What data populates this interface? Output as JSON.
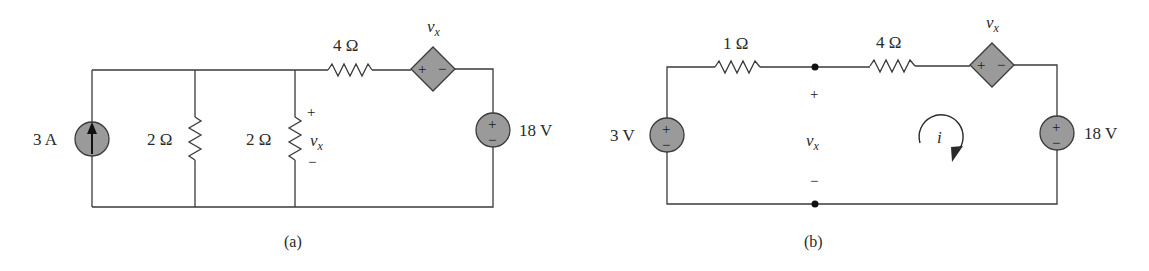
{
  "figure": {
    "panels": [
      {
        "id": "a",
        "caption": "(a)",
        "components": {
          "current_source": {
            "label": "3 A",
            "direction": "up"
          },
          "resistor_1": {
            "label": "2 Ω"
          },
          "resistor_2": {
            "label": "2 Ω",
            "voltage": {
              "plus": "+",
              "var": "v",
              "sub": "x",
              "minus": "−"
            }
          },
          "resistor_3": {
            "label": "4 Ω"
          },
          "dependent_source": {
            "label_var": "v",
            "label_sub": "x",
            "plus": "+",
            "minus": "−"
          },
          "voltage_source": {
            "label": "18 V",
            "plus": "+",
            "minus": "−"
          }
        }
      },
      {
        "id": "b",
        "caption": "(b)",
        "components": {
          "voltage_source_left": {
            "label": "3 V",
            "plus": "+",
            "minus": "−"
          },
          "resistor_1": {
            "label": "1 Ω"
          },
          "resistor_2": {
            "label": "4 Ω"
          },
          "node_voltage": {
            "plus": "+",
            "var": "v",
            "sub": "x",
            "minus": "−"
          },
          "dependent_source": {
            "label_var": "v",
            "label_sub": "x",
            "plus": "+",
            "minus": "−"
          },
          "voltage_source_right": {
            "label": "18 V",
            "plus": "+",
            "minus": "−"
          },
          "mesh_current": {
            "label": "i",
            "direction": "clockwise"
          }
        }
      }
    ]
  },
  "colors": {
    "wire": "#3a3a3a",
    "source_fill": "#9a9a9a",
    "text": "#2a2a2a",
    "background": "#ffffff"
  }
}
